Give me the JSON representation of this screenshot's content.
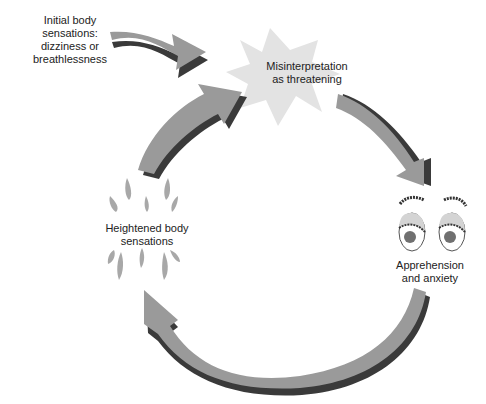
{
  "diagram": {
    "type": "cycle",
    "colors": {
      "arrow_fill": "#9a9a9a",
      "arrow_shadow": "#3a3a3a",
      "star_fill": "#e3e3e3",
      "droplet_fill": "#a8a8a8",
      "eye_lid": "#d4d4d4",
      "pupil": "#707070",
      "background": "#ffffff"
    },
    "entry": {
      "label_lines": [
        "Initial body",
        "sensations:",
        "dizziness or",
        "breathlessness"
      ],
      "arrow_to": "misinterpretation"
    },
    "nodes": [
      {
        "id": "misinterpretation",
        "label_lines": [
          "Misinterpretation",
          "as threatening"
        ],
        "icon": "star-burst-icon"
      },
      {
        "id": "apprehension",
        "label_lines": [
          "Apprehension",
          "and anxiety"
        ],
        "icon": "worried-eyes-icon"
      },
      {
        "id": "heightened",
        "label_lines": [
          "Heightened body",
          "sensations"
        ],
        "icon": "sweat-droplets-icon"
      }
    ],
    "edges": [
      {
        "from": "entry",
        "to": "misinterpretation"
      },
      {
        "from": "misinterpretation",
        "to": "apprehension"
      },
      {
        "from": "apprehension",
        "to": "heightened"
      },
      {
        "from": "heightened",
        "to": "misinterpretation"
      }
    ]
  }
}
